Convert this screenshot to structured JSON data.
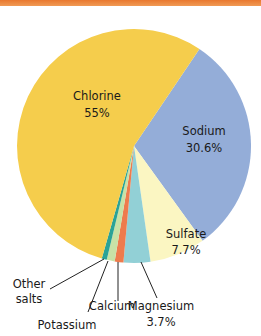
{
  "header": {
    "bar_color": "#ec8340"
  },
  "chart_data": {
    "type": "pie",
    "title": "",
    "start_angle_deg": 34,
    "direction": "clockwise",
    "slices": [
      {
        "label": "Sodium",
        "value": 30.6,
        "display": "30.6%",
        "color": "#94add8"
      },
      {
        "label": "Sulfate",
        "value": 7.7,
        "display": "7.7%",
        "color": "#fbf6c2"
      },
      {
        "label": "Magnesium",
        "value": 3.7,
        "display": "3.7%",
        "color": "#92d0d6"
      },
      {
        "label": "Calcium",
        "value": 1.2,
        "display": "",
        "color": "#ee7b4d"
      },
      {
        "label": "Potassium",
        "value": 1.1,
        "display": "",
        "color": "#c8e2a6"
      },
      {
        "label": "Other salts",
        "value": 0.7,
        "display": "",
        "color": "#2aa396"
      },
      {
        "label": "Chlorine",
        "value": 55,
        "display": "55%",
        "color": "#f5cd4c"
      }
    ],
    "labels": {
      "chlorine": {
        "name": "Chlorine",
        "pct": "55%"
      },
      "sodium": {
        "name": "Sodium",
        "pct": "30.6%"
      },
      "sulfate": {
        "name": "Sulfate",
        "pct": "7.7%"
      },
      "magnesium": {
        "name": "Magnesium",
        "pct": "3.7%"
      },
      "calcium": {
        "name": "Calcium"
      },
      "potassium": {
        "name": "Potassium"
      },
      "other": {
        "line1": "Other",
        "line2": "salts"
      }
    }
  }
}
